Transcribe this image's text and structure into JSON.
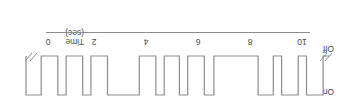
{
  "figure": {
    "orientation_degrees": 180,
    "type": "timing-diagram",
    "stroke_color": "#8d8d8d",
    "text_color": "#4a4a4a",
    "background": "#ffffff"
  },
  "axis": {
    "title": "Time",
    "unit": "(sec)",
    "tick_labels": [
      "10",
      "8",
      "6",
      "4",
      "2",
      "0"
    ],
    "tick_values": [
      10,
      8,
      6,
      4,
      2,
      0
    ],
    "break_marks": 2
  },
  "state_labels": {
    "high": "Off",
    "low": "On"
  },
  "chart_data": {
    "type": "line",
    "title": "",
    "xlabel": "Time (sec)",
    "ylabel": "",
    "xlim": [
      0,
      11
    ],
    "ylim": [
      0,
      1
    ],
    "grid": false,
    "legend": "none",
    "categories": [
      "Off",
      "On"
    ],
    "annotations": [
      "Off",
      "On",
      "Time",
      "(sec)"
    ],
    "series": [
      {
        "name": "state",
        "state_names": {
          "1": "Off",
          "0": "On"
        },
        "x": [
          0.0,
          0.25,
          0.85,
          1.15,
          1.75,
          2.05,
          2.6,
          3.55,
          4.2,
          4.55,
          5.15,
          5.45,
          6.0,
          6.3,
          6.9,
          8.05,
          8.65,
          8.95,
          9.55,
          9.85,
          10.45,
          11.0
        ],
        "values": [
          1,
          0,
          1,
          0,
          1,
          0,
          1,
          1,
          0,
          1,
          0,
          1,
          0,
          1,
          0,
          1,
          0,
          1,
          0,
          1,
          0,
          1
        ]
      }
    ]
  }
}
